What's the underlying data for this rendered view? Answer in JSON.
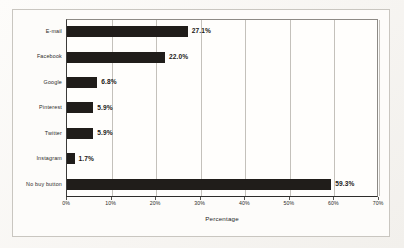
{
  "chart_data": {
    "type": "bar",
    "orientation": "horizontal",
    "title": "",
    "xlabel": "Percentage",
    "ylabel": "",
    "xlim": [
      0,
      70
    ],
    "grid": true,
    "legend": false,
    "categories": [
      "E-mail",
      "Facebook",
      "Google",
      "Pinterest",
      "Twitter",
      "Instagram",
      "No buy button"
    ],
    "values": [
      27.1,
      22.0,
      6.8,
      5.9,
      5.9,
      1.7,
      59.3
    ],
    "value_labels": [
      "27.1%",
      "22.0%",
      "6.8%",
      "5.9%",
      "5.9%",
      "1.7%",
      "59.3%"
    ],
    "xticks": [
      0,
      10,
      20,
      30,
      40,
      50,
      60,
      70
    ],
    "xtick_labels": [
      "0%",
      "10%",
      "20%",
      "30%",
      "40%",
      "50%",
      "60%",
      "70%"
    ],
    "bar_color": "#201d1a",
    "gridline_color": "#c4c1bb",
    "background_color": "#fdfcfa"
  }
}
